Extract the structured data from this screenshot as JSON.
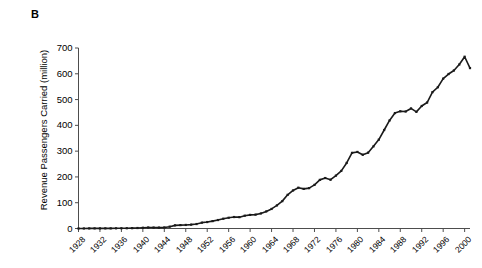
{
  "panel": {
    "label": "B"
  },
  "axes": {
    "ylabel": "Revenue Passengers Carried (million)",
    "xlabel": "",
    "yticks": [
      0,
      100,
      200,
      300,
      400,
      500,
      600,
      700
    ],
    "xticks": [
      1928,
      1932,
      1936,
      1940,
      1944,
      1948,
      1952,
      1956,
      1960,
      1964,
      1968,
      1972,
      1976,
      1980,
      1984,
      1988,
      1992,
      1996,
      2000
    ]
  },
  "colors": {
    "line": "#1a1a1a",
    "axis": "#4d4d4d",
    "background": "#ffffff",
    "text": "#000000"
  },
  "chart_data": {
    "type": "line",
    "title": "",
    "xlabel": "",
    "ylabel": "Revenue Passengers Carried (million)",
    "xlim": [
      1928,
      2001
    ],
    "ylim": [
      0,
      700
    ],
    "grid": false,
    "legend": null,
    "markers": "small filled squares at each annual point",
    "series": [
      {
        "name": "Revenue passengers carried",
        "x": [
          1928,
          1929,
          1930,
          1931,
          1932,
          1933,
          1934,
          1935,
          1936,
          1937,
          1938,
          1939,
          1940,
          1941,
          1942,
          1943,
          1944,
          1945,
          1946,
          1947,
          1948,
          1949,
          1950,
          1951,
          1952,
          1953,
          1954,
          1955,
          1956,
          1957,
          1958,
          1959,
          1960,
          1961,
          1962,
          1963,
          1964,
          1965,
          1966,
          1967,
          1968,
          1969,
          1970,
          1971,
          1972,
          1973,
          1974,
          1975,
          1976,
          1977,
          1978,
          1979,
          1980,
          1981,
          1982,
          1983,
          1984,
          1985,
          1986,
          1987,
          1988,
          1989,
          1990,
          1991,
          1992,
          1993,
          1994,
          1995,
          1996,
          1997,
          1998,
          1999,
          2000,
          2001
        ],
        "y": [
          0.1,
          0.2,
          0.4,
          0.5,
          0.5,
          0.6,
          0.6,
          0.7,
          1.0,
          1.1,
          1.3,
          1.9,
          2.9,
          4.0,
          3.6,
          3.5,
          4.1,
          7.1,
          12.2,
          13.2,
          13.8,
          15.1,
          17.3,
          22.7,
          25.0,
          28.7,
          32.8,
          38.0,
          41.7,
          44.5,
          44.0,
          49.7,
          52.7,
          53.8,
          58.5,
          66.2,
          75.8,
          89.6,
          106.1,
          130.6,
          147.5,
          158.3,
          153.7,
          156.5,
          169.0,
          188.6,
          195.7,
          189.1,
          205.1,
          223.3,
          254.2,
          293.3,
          296.9,
          285.9,
          294.1,
          318.6,
          344.7,
          382.0,
          418.9,
          447.6,
          454.6,
          453.7,
          465.6,
          452.3,
          475.1,
          488.5,
          528.8,
          547.8,
          581.2,
          599.1,
          612.9,
          636.0,
          666.2,
          622.1
        ]
      }
    ]
  }
}
